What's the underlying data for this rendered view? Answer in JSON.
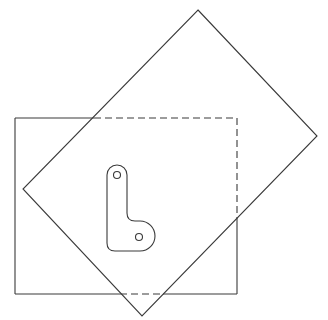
{
  "diagram": {
    "stroke_color": "#3a3a3a",
    "background_color": "#ffffff",
    "shapes": {
      "square": {
        "x": 15,
        "y": 118,
        "width": 223,
        "height": 176
      },
      "rotated_square": {
        "points": [
          [
            198,
            10
          ],
          [
            317,
            136
          ],
          [
            142,
            316
          ],
          [
            23,
            189
          ]
        ]
      },
      "l_part": {
        "hole_top": {
          "cx": 117,
          "cy": 175,
          "r": 3.5
        },
        "hole_bottom": {
          "cx": 139,
          "cy": 237,
          "r": 3.5
        }
      }
    }
  }
}
